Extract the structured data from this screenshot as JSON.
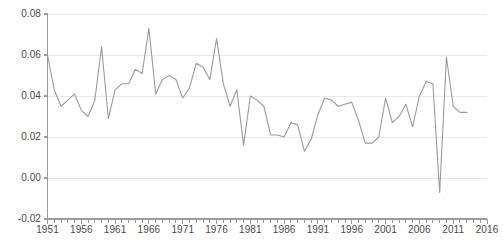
{
  "chart_data": {
    "type": "line",
    "title": "",
    "xlabel": "",
    "ylabel": "",
    "xlim": [
      1951,
      2016
    ],
    "ylim": [
      -0.02,
      0.08
    ],
    "grid": true,
    "legend": null,
    "y_ticks": [
      "0.08",
      "0.06",
      "0.04",
      "0.02",
      "0.00",
      "-0.02"
    ],
    "y_tick_values": [
      0.08,
      0.06,
      0.04,
      0.02,
      0.0,
      -0.02
    ],
    "x_ticks": [
      "1951",
      "1956",
      "1961",
      "1966",
      "1971",
      "1976",
      "1981",
      "1986",
      "1991",
      "1996",
      "2001",
      "2006",
      "2011",
      "2016"
    ],
    "x_tick_values": [
      1951,
      1956,
      1961,
      1966,
      1971,
      1976,
      1981,
      1986,
      1991,
      1996,
      2001,
      2006,
      2011,
      2016
    ],
    "x_minor_step": 1,
    "line_color": "#9a9a9a",
    "grid_color": "#e8e8ec",
    "axis_color": "#9a9a9a",
    "text_color": "#4a4a4a",
    "series": [
      {
        "name": "series-1",
        "x": [
          1951,
          1952,
          1953,
          1954,
          1955,
          1956,
          1957,
          1958,
          1959,
          1960,
          1961,
          1962,
          1963,
          1964,
          1965,
          1966,
          1967,
          1968,
          1969,
          1970,
          1971,
          1972,
          1973,
          1974,
          1975,
          1976,
          1977,
          1978,
          1979,
          1980,
          1981,
          1982,
          1983,
          1984,
          1985,
          1986,
          1987,
          1988,
          1989,
          1990,
          1991,
          1992,
          1993,
          1994,
          1995,
          1996,
          1997,
          1998,
          1999,
          2000,
          2001,
          2002,
          2003,
          2004,
          2005,
          2006,
          2007,
          2008,
          2009,
          2010,
          2011,
          2012,
          2013
        ],
        "values": [
          0.06,
          0.043,
          0.035,
          0.038,
          0.041,
          0.033,
          0.03,
          0.038,
          0.064,
          0.029,
          0.043,
          0.046,
          0.046,
          0.053,
          0.051,
          0.073,
          0.041,
          0.048,
          0.05,
          0.048,
          0.039,
          0.044,
          0.056,
          0.054,
          0.048,
          0.068,
          0.046,
          0.035,
          0.043,
          0.016,
          0.04,
          0.038,
          0.035,
          0.021,
          0.021,
          0.02,
          0.027,
          0.026,
          0.013,
          0.019,
          0.031,
          0.039,
          0.038,
          0.035,
          0.036,
          0.037,
          0.028,
          0.017,
          0.017,
          0.02,
          0.039,
          0.027,
          0.03,
          0.036,
          0.025,
          0.04,
          0.047,
          0.046,
          -0.007,
          0.059,
          0.035,
          0.032,
          0.032
        ]
      }
    ]
  }
}
